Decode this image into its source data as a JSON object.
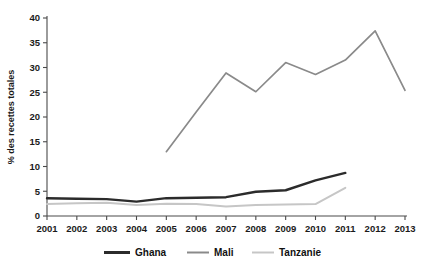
{
  "chart_data": {
    "type": "line",
    "title": "",
    "subtitle": "",
    "xlabel": "",
    "ylabel": "% des recettes totales",
    "x": [
      2001,
      2002,
      2003,
      2004,
      2005,
      2006,
      2007,
      2008,
      2009,
      2010,
      2011,
      2012,
      2013
    ],
    "xtick_labels": [
      "2001",
      "2002",
      "2003",
      "2004",
      "2005",
      "2006",
      "2007",
      "2008",
      "2009",
      "2010",
      "2011",
      "2012",
      "2013"
    ],
    "ytick_labels": [
      "0",
      "5",
      "10",
      "15",
      "20",
      "25",
      "30",
      "35",
      "40"
    ],
    "yticks": [
      0,
      5,
      10,
      15,
      20,
      25,
      30,
      35,
      40
    ],
    "ylim": [
      0,
      40
    ],
    "xlim": [
      2001,
      2013
    ],
    "grid": false,
    "legend_position": "bottom",
    "series": [
      {
        "name": "Ghana",
        "color": "#2b2b2b",
        "width": 2.4,
        "x": [
          2001,
          2002,
          2003,
          2004,
          2005,
          2006,
          2007,
          2008,
          2009,
          2010,
          2011
        ],
        "values": [
          3.6,
          3.5,
          3.4,
          2.9,
          3.6,
          3.7,
          3.8,
          4.9,
          5.2,
          7.2,
          8.7
        ]
      },
      {
        "name": "Mali",
        "color": "#8a8a8a",
        "width": 1.7,
        "x": [
          2005,
          2006,
          2007,
          2008,
          2009,
          2010,
          2011,
          2012,
          2013
        ],
        "values": [
          13.0,
          21.0,
          28.9,
          25.1,
          31.0,
          28.6,
          31.5,
          37.4,
          25.4
        ]
      },
      {
        "name": "Tanzanie",
        "color": "#c6c6c6",
        "width": 2.0,
        "x": [
          2001,
          2002,
          2003,
          2004,
          2005,
          2006,
          2007,
          2008,
          2009,
          2010,
          2011
        ],
        "values": [
          2.4,
          2.6,
          2.7,
          2.2,
          2.5,
          2.4,
          1.9,
          2.2,
          2.3,
          2.4,
          5.7
        ]
      }
    ],
    "legend": [
      {
        "label": "Ghana",
        "color": "#2b2b2b"
      },
      {
        "label": "Mali",
        "color": "#8a8a8a"
      },
      {
        "label": "Tanzanie",
        "color": "#c6c6c6"
      }
    ]
  }
}
